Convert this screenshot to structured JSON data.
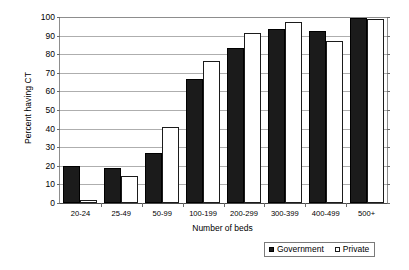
{
  "chart_data": {
    "type": "bar",
    "title": "",
    "xlabel": "Number of beds",
    "ylabel": "Percent having CT",
    "categories": [
      "20-24",
      "25-49",
      "50-99",
      "100-199",
      "200-299",
      "300-399",
      "400-499",
      "500+"
    ],
    "series": [
      {
        "name": "Government",
        "color": "#1b1b1b",
        "values": [
          20,
          19,
          27,
          66.5,
          83.5,
          93.5,
          92.5,
          99.5
        ]
      },
      {
        "name": "Private",
        "color": "#ffffff",
        "values": [
          1.5,
          14.5,
          41,
          76.5,
          91.5,
          97.5,
          87,
          99
        ]
      }
    ],
    "ylim": [
      0,
      100
    ],
    "yticks": [
      0,
      10,
      20,
      30,
      40,
      50,
      60,
      70,
      80,
      90,
      100
    ],
    "ytick_labels": [
      "0",
      "10",
      "20",
      "30",
      "40",
      "50",
      "60",
      "70",
      "80",
      "90",
      "100"
    ],
    "grid": true,
    "legend_position": "bottom-right"
  },
  "legend": {
    "entries": [
      {
        "label": "Government"
      },
      {
        "label": "Private"
      }
    ]
  }
}
